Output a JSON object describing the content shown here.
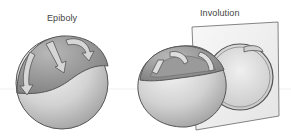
{
  "diagram": {
    "panels": [
      {
        "id": "epiboly",
        "label": "Epiboly"
      },
      {
        "id": "involution",
        "label": "Involution"
      }
    ],
    "colors": {
      "outline": "#555555",
      "sphere_light": "#e6e6e6",
      "sphere_mid": "#b8b8b8",
      "sphere_dark": "#8c8c8c",
      "arrow_fill": "#d4d4d4",
      "plane": "#f2f2f2",
      "background_line": "#eeeeee"
    },
    "icons": [
      "curved-arrow-icon",
      "curved-arrow-icon",
      "curved-arrow-icon"
    ]
  }
}
